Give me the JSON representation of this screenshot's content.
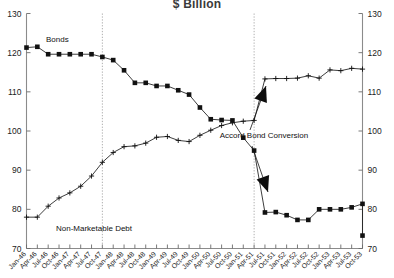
{
  "chart_data": {
    "type": "line",
    "title": "$ Billion",
    "xlabel": "",
    "ylabel": "",
    "ylim": [
      70,
      130
    ],
    "ytick_labels_left": [
      "130",
      "120",
      "110",
      "100",
      "90",
      "80",
      "70"
    ],
    "ytick_labels_right": [
      "130",
      "120",
      "110",
      "100",
      "90",
      "80",
      "70"
    ],
    "yticks": [
      130,
      120,
      110,
      100,
      90,
      80,
      70
    ],
    "grid": false,
    "legend": "inline-labels",
    "categories": [
      "Jan-46",
      "Apr-46",
      "Jul-46",
      "Oct-46",
      "Jan-47",
      "Apr-47",
      "Jul-47",
      "Oct-47",
      "Jan-48",
      "Apr-48",
      "Jul-48",
      "Oct-48",
      "Jan-49",
      "Apr-49",
      "Jul-49",
      "Oct-49",
      "Jan-50",
      "Apr-50",
      "Jul-50",
      "Oct-50",
      "Jan-51",
      "Apr-51",
      "Jul-51",
      "Oct-51",
      "Jan-52",
      "Apr-52",
      "Jul-52",
      "Oct-52",
      "Jan-53",
      "Apr-53",
      "Jul-53",
      "Oct-53"
    ],
    "xtick_labels": [
      "Jan-46",
      "Apr-46",
      "Jul-46",
      "Oct-46",
      "Jan-47",
      "Apr-47",
      "Jul-47",
      "Oct-47",
      "Jan-48",
      "Apr-48",
      "Jul-48",
      "Oct-48",
      "Jan-49",
      "Apr-49",
      "Jul-49",
      "Oct-49",
      "Jan-50",
      "Apr-50",
      "Jul-50",
      "Oct-50",
      "Jan-51",
      "Apr-51",
      "Jul-51",
      "Oct-51",
      "Jan-52",
      "Apr-52",
      "Jul-52",
      "Oct-52",
      "Jan-53",
      "Apr-53",
      "Jul-53",
      "Oct-53"
    ],
    "series": [
      {
        "name": "Bonds",
        "marker": "filled-square",
        "label": "Bonds",
        "values": [
          121.3,
          121.5,
          119.6,
          119.6,
          119.6,
          119.6,
          119.6,
          118.9,
          118.1,
          115.5,
          112.3,
          112.3,
          111.5,
          111.5,
          110.4,
          109.3,
          106.0,
          103.0,
          102.8,
          102.7,
          98.3,
          95.0,
          79.2,
          79.3,
          78.5,
          77.3,
          77.3,
          80.0,
          80.0,
          80.0,
          80.5,
          81.4
        ],
        "final_value": 73.3
      },
      {
        "name": "Non-Marketable Debt",
        "marker": "plus",
        "label": "Non-Marketable Debt",
        "values": [
          78.0,
          78.0,
          80.8,
          82.9,
          84.2,
          85.9,
          88.5,
          92.0,
          94.5,
          96.0,
          96.2,
          96.9,
          98.4,
          98.6,
          97.6,
          97.3,
          98.9,
          100.2,
          101.4,
          102.1,
          102.5,
          102.7,
          113.3,
          113.4,
          113.4,
          113.5,
          114.1,
          113.5,
          115.6,
          115.4,
          116.0,
          115.8
        ]
      }
    ],
    "annotations": [
      {
        "name": "accord-bond-conversion",
        "text": "Accord Bond Conversion",
        "x": 264,
        "y": 138
      },
      {
        "name": "bonds-series-label",
        "text": "Bonds",
        "x": 46,
        "y": 42
      },
      {
        "name": "non-marketable-debt-series-label",
        "text": "Non-Marketable Debt",
        "x": 56,
        "y": 231
      }
    ],
    "vertical_markers": [
      {
        "name": "dotted-line-left",
        "x_label": "Oct-47"
      },
      {
        "name": "dotted-line-right",
        "x_label": "Apr-51"
      }
    ]
  }
}
